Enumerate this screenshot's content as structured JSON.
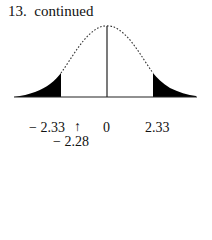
{
  "title": "13.  continued",
  "diagram": {
    "type": "normal-distribution-curve",
    "shaded_regions": [
      "left-tail",
      "right-tail"
    ],
    "center_line": true,
    "labels": {
      "left_critical": "− 2.33",
      "arrow": "↑",
      "center": "0",
      "right_critical": "2.33",
      "test_value": "− 2.28"
    },
    "colors": {
      "curve": "#333333",
      "fill": "#000000",
      "axis": "#222222"
    }
  }
}
